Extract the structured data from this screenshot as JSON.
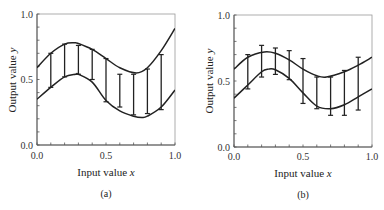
{
  "chart_data": [
    {
      "type": "line",
      "panel": "(a)",
      "caption": "(a)",
      "xlabel": "Input value x",
      "ylabel": "Output value y",
      "xlim": [
        0,
        1
      ],
      "ylim": [
        0,
        1
      ],
      "xticks": [
        0.0,
        0.5,
        1.0
      ],
      "yticks": [
        0.0,
        0.5,
        1.0
      ],
      "x_tick_labels": [
        "0.0",
        "0.5",
        "1.0"
      ],
      "y_tick_labels": [
        "0.0",
        "0.5",
        "1.0"
      ],
      "minor_tick_step": 0.1,
      "grid": false,
      "series": [
        {
          "name": "upper bound",
          "x": [
            0.0,
            0.1,
            0.2,
            0.27,
            0.3,
            0.4,
            0.5,
            0.6,
            0.72,
            0.8,
            0.9,
            1.0
          ],
          "values": [
            0.59,
            0.7,
            0.77,
            0.78,
            0.775,
            0.73,
            0.66,
            0.59,
            0.55,
            0.59,
            0.72,
            0.89
          ]
        },
        {
          "name": "lower bound",
          "x": [
            0.0,
            0.1,
            0.2,
            0.28,
            0.3,
            0.4,
            0.5,
            0.6,
            0.7,
            0.76,
            0.8,
            0.9,
            1.0
          ],
          "values": [
            0.35,
            0.44,
            0.52,
            0.54,
            0.54,
            0.48,
            0.34,
            0.26,
            0.22,
            0.21,
            0.22,
            0.29,
            0.42
          ]
        }
      ],
      "error_bars": {
        "x": [
          0.1,
          0.2,
          0.3,
          0.4,
          0.5,
          0.6,
          0.7,
          0.8,
          0.9
        ],
        "upper": [
          0.7,
          0.77,
          0.76,
          0.73,
          0.66,
          0.54,
          0.54,
          0.58,
          0.69
        ],
        "lower": [
          0.44,
          0.52,
          0.54,
          0.5,
          0.33,
          0.29,
          0.23,
          0.24,
          0.27
        ]
      }
    },
    {
      "type": "line",
      "panel": "(b)",
      "caption": "(b)",
      "xlabel": "Input value x",
      "ylabel": "Output value y",
      "xlim": [
        0,
        1
      ],
      "ylim": [
        0,
        1
      ],
      "xticks": [
        0.0,
        0.5,
        1.0
      ],
      "yticks": [
        0.0,
        0.5,
        1.0
      ],
      "x_tick_labels": [
        "0.0",
        "0.5",
        "1.0"
      ],
      "y_tick_labels": [
        "0.0",
        "0.5",
        "1.0"
      ],
      "minor_tick_step": 0.1,
      "grid": false,
      "series": [
        {
          "name": "upper bound",
          "x": [
            0.0,
            0.1,
            0.22,
            0.3,
            0.4,
            0.5,
            0.6,
            0.67,
            0.8,
            0.9,
            1.0
          ],
          "values": [
            0.59,
            0.68,
            0.72,
            0.71,
            0.66,
            0.59,
            0.54,
            0.53,
            0.57,
            0.62,
            0.68
          ]
        },
        {
          "name": "lower bound",
          "x": [
            0.0,
            0.1,
            0.2,
            0.25,
            0.3,
            0.4,
            0.5,
            0.6,
            0.7,
            0.8,
            0.9,
            1.0
          ],
          "values": [
            0.37,
            0.47,
            0.57,
            0.59,
            0.585,
            0.52,
            0.41,
            0.31,
            0.29,
            0.32,
            0.38,
            0.44
          ]
        }
      ],
      "error_bars": {
        "x": [
          0.1,
          0.2,
          0.3,
          0.4,
          0.5,
          0.6,
          0.7,
          0.8,
          0.9
        ],
        "upper": [
          0.7,
          0.77,
          0.75,
          0.73,
          0.67,
          0.53,
          0.53,
          0.58,
          0.68
        ],
        "lower": [
          0.44,
          0.53,
          0.55,
          0.51,
          0.33,
          0.29,
          0.24,
          0.24,
          0.28
        ]
      }
    }
  ],
  "panels": [
    {
      "caption": "(a)",
      "xlabel": "Input value ",
      "xvar": "x",
      "ylabel": "Output value ",
      "yvar": "y",
      "ticks": {
        "x0": "0.0",
        "x5": "0.5",
        "x1": "1.0",
        "y0": "0.0",
        "y5": "0.5",
        "y1": "1.0"
      }
    },
    {
      "caption": "(b)",
      "xlabel": "Input value ",
      "xvar": "x",
      "ylabel": "Output value ",
      "yvar": "y",
      "ticks": {
        "x0": "0.0",
        "x5": "0.5",
        "x1": "1.0",
        "y0": "0.0",
        "y5": "0.5",
        "y1": "1.0"
      }
    }
  ],
  "colors": {
    "line": "#222222",
    "axis": "#555555",
    "background": "#ffffff"
  }
}
